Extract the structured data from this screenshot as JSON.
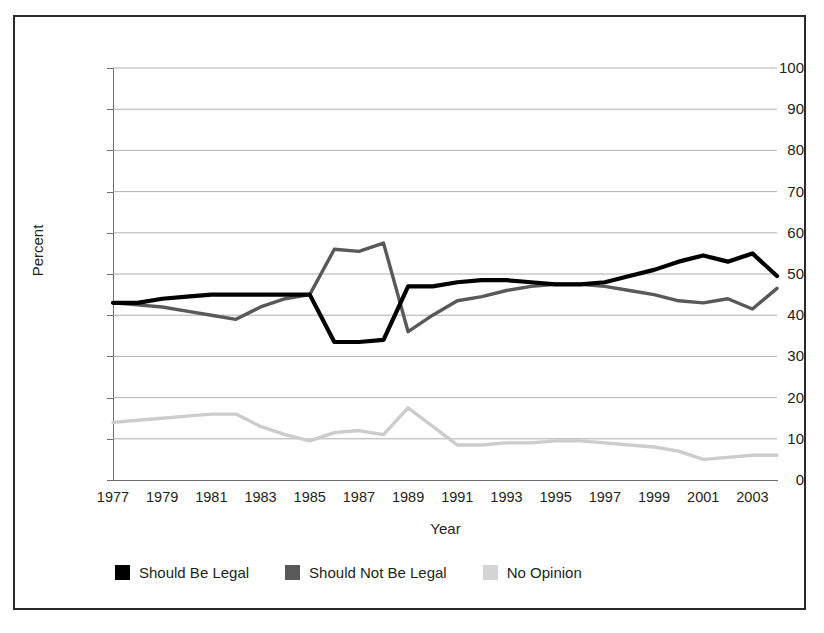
{
  "chart_data": {
    "type": "line",
    "title": "",
    "xlabel": "Year",
    "ylabel": "Percent",
    "ylim": [
      0,
      100
    ],
    "ytick_step": 10,
    "yticks": [
      100,
      90,
      80,
      70,
      60,
      50,
      40,
      30,
      20,
      10,
      0
    ],
    "xlim": [
      1977,
      2004
    ],
    "xticks": [
      1977,
      1979,
      1981,
      1983,
      1985,
      1987,
      1989,
      1991,
      1993,
      1995,
      1997,
      1999,
      2001,
      2003
    ],
    "grid": "horizontal",
    "legend_position": "bottom-left",
    "x": [
      1977,
      1978,
      1979,
      1980,
      1981,
      1982,
      1983,
      1984,
      1985,
      1986,
      1987,
      1988,
      1989,
      1990,
      1991,
      1992,
      1993,
      1994,
      1995,
      1996,
      1997,
      1998,
      1999,
      2000,
      2001,
      2002,
      2003,
      2004
    ],
    "series": [
      {
        "name": "Should Be Legal",
        "color": "#000000",
        "values": [
          43,
          43,
          44,
          44.5,
          45,
          45,
          45,
          45,
          45,
          33.5,
          33.5,
          34,
          47,
          47,
          48,
          48.5,
          48.5,
          48,
          47.5,
          47.5,
          48,
          49.5,
          51,
          53,
          54.5,
          53,
          55,
          49.5
        ]
      },
      {
        "name": "Should Not Be Legal",
        "color": "#595959",
        "values": [
          43,
          42.5,
          42,
          41,
          40,
          39,
          42,
          44,
          45,
          56,
          55.5,
          57.5,
          36,
          40,
          43.5,
          44.5,
          46,
          47,
          47.5,
          47.5,
          47,
          46,
          45,
          43.5,
          43,
          44,
          41.5,
          46.5
        ]
      },
      {
        "name": "No Opinion",
        "color": "#cccccc",
        "values": [
          14,
          14.5,
          15,
          15.5,
          16,
          16,
          13,
          11,
          9.5,
          11.5,
          12,
          11,
          17.5,
          13,
          8.5,
          8.5,
          9,
          9,
          9.5,
          9.5,
          9,
          8.5,
          8,
          7,
          5,
          5.5,
          6,
          6
        ]
      }
    ]
  },
  "legend": {
    "items": [
      {
        "label": "Should Be Legal",
        "color": "#000000"
      },
      {
        "label": "Should Not Be Legal",
        "color": "#595959"
      },
      {
        "label": "No Opinion",
        "color": "#d4d4d4"
      }
    ]
  },
  "axes": {
    "y_title": "Percent",
    "x_title": "Year"
  }
}
